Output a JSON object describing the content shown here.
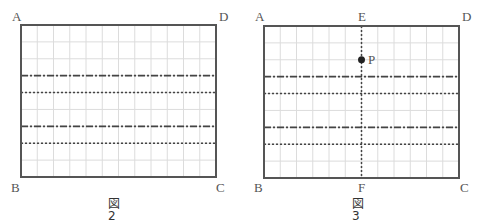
{
  "colors": {
    "grid": "#dcdcdc",
    "border": "#555555",
    "line": "#444444",
    "point": "#222222",
    "label": "#555555"
  },
  "grid": {
    "columns": 12,
    "rows": 9
  },
  "figures": [
    {
      "id": "fig2",
      "caption": "図 2",
      "rect": {
        "x": 21,
        "y": 25,
        "w": 195,
        "h": 152
      },
      "corners": {
        "A": "A",
        "B": "B",
        "C": "C",
        "D": "D"
      },
      "horizontal_lines": [
        {
          "row": 3,
          "style": "dash-dot"
        },
        {
          "row": 4,
          "style": "dotted"
        },
        {
          "row": 6,
          "style": "dash-dot"
        },
        {
          "row": 7,
          "style": "dotted"
        }
      ]
    },
    {
      "id": "fig3",
      "caption": "図 3",
      "rect": {
        "x": 264,
        "y": 26,
        "w": 195,
        "h": 152
      },
      "corners": {
        "A": "A",
        "B": "B",
        "C": "C",
        "D": "D"
      },
      "midpoints": {
        "E": "E",
        "F": "F"
      },
      "vertical_line": {
        "col": 6,
        "style": "dotted",
        "top_label": "E",
        "bottom_label": "F"
      },
      "point": {
        "label": "P",
        "col": 6,
        "row": 2
      },
      "horizontal_lines": [
        {
          "row": 3,
          "style": "dash-dot"
        },
        {
          "row": 4,
          "style": "dotted"
        },
        {
          "row": 6,
          "style": "dash-dot"
        },
        {
          "row": 7,
          "style": "dotted"
        }
      ]
    }
  ]
}
